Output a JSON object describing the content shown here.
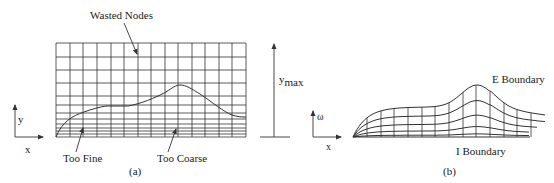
{
  "figure": {
    "panel_a": {
      "caption": "(a)",
      "labels": {
        "wasted_nodes": "Wasted Nodes",
        "too_fine": "Too Fine",
        "too_coarse": "Too Coarse",
        "ymax_main": "y",
        "ymax_sub": "max"
      },
      "axes": {
        "x": "x",
        "y": "y"
      },
      "grid": {
        "x_lines": [
          56,
          70,
          83,
          97,
          111,
          124,
          138,
          151,
          165,
          178,
          192,
          205,
          219,
          232,
          246
        ],
        "y_lines": [
          43,
          57,
          70,
          83,
          96,
          105,
          113,
          119,
          124,
          128,
          131,
          134,
          137
        ]
      }
    },
    "panel_b": {
      "caption": "(b)",
      "labels": {
        "e_boundary": "E Boundary",
        "i_boundary": "I Boundary"
      },
      "axes": {
        "x": "x",
        "y": "ω"
      }
    }
  }
}
